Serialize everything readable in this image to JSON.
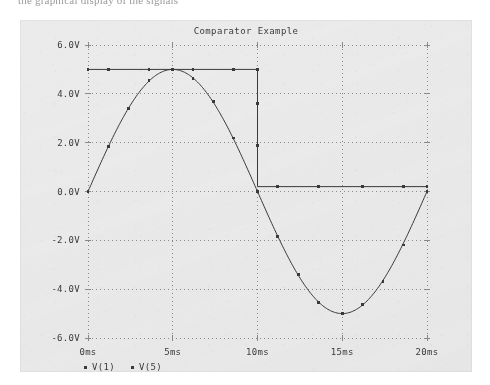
{
  "page": {
    "top_text_fragment": "the graphical display of the signals"
  },
  "figure": {
    "title": "Comparator Example",
    "x_axis_title": "Time",
    "legend": [
      {
        "marker": "square-marker",
        "label": "V(1)"
      },
      {
        "marker": "square-marker",
        "label": "V(5)"
      }
    ],
    "colors": {
      "panel_background": "#ebebeb",
      "grid": "#8a8a8a",
      "trace": "#3a3a3a",
      "text": "#3b3b3b"
    }
  },
  "chart_data": {
    "type": "line",
    "title": "Comparator Example",
    "xlabel": "Time",
    "ylabel": "",
    "xlim": [
      0,
      20
    ],
    "ylim": [
      -6,
      6
    ],
    "x_unit": "ms",
    "y_unit": "V",
    "grid": true,
    "grid_style": "dotted",
    "legend_position": "below-axis-left",
    "x_ticks": [
      0,
      5,
      10,
      15,
      20
    ],
    "x_tick_labels": [
      "0ms",
      "5ms",
      "10ms",
      "15ms",
      "20ms"
    ],
    "y_ticks": [
      -6,
      -4,
      -2,
      0,
      2,
      4,
      6
    ],
    "y_tick_labels": [
      "-6.0V",
      "-4.0V",
      "-2.0V",
      "0.0V",
      "2.0V",
      "4.0V",
      "6.0V"
    ],
    "series": [
      {
        "name": "V(1)",
        "description": "input sine wave, 5V amplitude, 50Hz (20ms period)",
        "shape": "sine",
        "amplitude": 5.0,
        "period_ms": 20,
        "x": [
          0,
          1,
          2,
          3,
          4,
          5,
          6,
          7,
          8,
          9,
          10,
          11,
          12,
          13,
          14,
          15,
          16,
          17,
          18,
          19,
          20
        ],
        "values": [
          0.0,
          1.55,
          2.94,
          4.05,
          4.76,
          5.0,
          4.76,
          4.05,
          2.94,
          1.55,
          0.0,
          -1.55,
          -2.94,
          -4.05,
          -4.76,
          -5.0,
          -4.76,
          -4.05,
          -2.94,
          -1.55,
          0.0
        ],
        "marker_x": [
          0,
          1.2,
          2.4,
          3.6,
          5.0,
          6.2,
          7.4,
          8.6,
          10.0,
          11.2,
          12.4,
          13.6,
          15.0,
          16.2,
          17.4,
          18.6,
          20.0
        ],
        "marker_values": [
          0.0,
          1.84,
          3.41,
          4.54,
          5.0,
          4.62,
          3.67,
          2.19,
          0.0,
          -1.84,
          -3.41,
          -4.54,
          -5.0,
          -4.62,
          -3.67,
          -2.19,
          0.0
        ]
      },
      {
        "name": "V(5)",
        "description": "comparator output, high 5V while input positive, low 0.2V while input negative",
        "shape": "square",
        "high_level": 5.0,
        "low_level": 0.2,
        "transition_ms": 10,
        "x": [
          0,
          10,
          10,
          20
        ],
        "values": [
          5.0,
          5.0,
          0.2,
          0.2
        ],
        "marker_x": [
          0,
          1.2,
          3.6,
          6.2,
          8.6,
          10.0,
          10.0,
          10.0,
          11.2,
          13.6,
          16.2,
          18.6,
          20.0
        ],
        "marker_values": [
          5.0,
          5.0,
          5.0,
          5.0,
          5.0,
          5.0,
          3.6,
          1.9,
          0.2,
          0.2,
          0.2,
          0.2,
          0.2
        ]
      }
    ]
  }
}
